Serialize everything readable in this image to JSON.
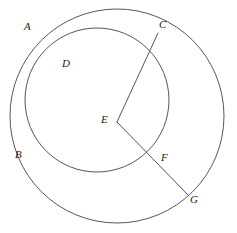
{
  "figure": {
    "background_color": "#ffffff",
    "stroke_color": "#56565c",
    "label_color": "#1d1d20",
    "width": 237,
    "height": 233
  },
  "labels": {
    "a": "A",
    "b": "B",
    "c": "C",
    "d": "D",
    "e": "E",
    "f": "F",
    "g": "G"
  },
  "geometry": {
    "circles": [
      {
        "name": "outer-circle",
        "cx": 117,
        "cy": 116,
        "r": 107,
        "passes_through": [
          "A",
          "B",
          "C",
          "G"
        ]
      },
      {
        "name": "inner-circle",
        "cx": 97,
        "cy": 100,
        "r": 72,
        "passes_through": [
          "B",
          "C",
          "D",
          "F"
        ]
      }
    ],
    "points": [
      {
        "name": "A",
        "x": 33,
        "y": 32,
        "label_x": 24,
        "label_y": 21
      },
      {
        "name": "B",
        "x": 33,
        "y": 150,
        "label_x": 15,
        "label_y": 149
      },
      {
        "name": "C",
        "x": 158,
        "y": 33,
        "label_x": 159,
        "label_y": 19
      },
      {
        "name": "D",
        "x": 74,
        "y": 58,
        "label_x": 62,
        "label_y": 58
      },
      {
        "name": "E",
        "x": 117,
        "y": 122,
        "label_x": 101,
        "label_y": 114
      },
      {
        "name": "F",
        "x": 152,
        "y": 153,
        "label_x": 161,
        "label_y": 152
      },
      {
        "name": "G",
        "x": 189,
        "y": 196,
        "label_x": 190,
        "label_y": 194
      }
    ],
    "segments": [
      {
        "name": "segment-EC",
        "from": "E",
        "to": "C",
        "x1": 117,
        "y1": 122,
        "x2": 158,
        "y2": 33
      },
      {
        "name": "segment-EG",
        "from": "E",
        "to": "G",
        "x1": 117,
        "y1": 122,
        "x2": 189,
        "y2": 196
      }
    ]
  }
}
